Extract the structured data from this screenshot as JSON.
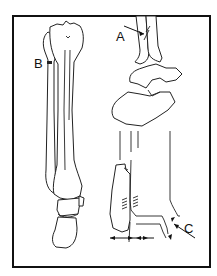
{
  "figure": {
    "type": "anatomical line drawing",
    "colors": {
      "line": "#222222",
      "background": "#ffffff",
      "frame": "#111111"
    },
    "labels": [
      {
        "id": "A",
        "text": "A",
        "position": "upper right, arrow pointing to distal fibula/tibia junction"
      },
      {
        "id": "B",
        "text": "B",
        "position": "left, marker on proximal fibula"
      },
      {
        "id": "C",
        "text": "C",
        "position": "lower right, arrow pointing to fracture gap at ankle"
      }
    ],
    "annotations": {
      "bottom_arrows": "double arrows along base indicating displacement"
    }
  }
}
